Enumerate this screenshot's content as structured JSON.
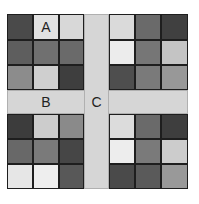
{
  "labels": {
    "a": "A",
    "b": "B",
    "c": "C"
  },
  "strip_color": "#d6d6d6",
  "blocks": {
    "top_left": [
      [
        "#4a4a4a",
        "#e2e2e2",
        "#d8d8d8"
      ],
      [
        "#5e5e5e",
        "#707070",
        "#6a6a6a"
      ],
      [
        "#8c8c8c",
        "#cfcfcf",
        "#3e3e3e"
      ]
    ],
    "top_right": [
      [
        "#dadada",
        "#6a6a6a",
        "#404040"
      ],
      [
        "#ececec",
        "#767676",
        "#c4c4c4"
      ],
      [
        "#4e4e4e",
        "#7a7a7a",
        "#989898"
      ]
    ],
    "bottom_left": [
      [
        "#3c3c3c",
        "#cccccc",
        "#8a8a8a"
      ],
      [
        "#686868",
        "#7a7a7a",
        "#464646"
      ],
      [
        "#e6e6e6",
        "#eeeeee",
        "#585858"
      ]
    ],
    "bottom_right": [
      [
        "#dcdcdc",
        "#6a6a6a",
        "#3e3e3e"
      ],
      [
        "#ededed",
        "#7a7a7a",
        "#cccccc"
      ],
      [
        "#4a4a4a",
        "#5a5a5a",
        "#999999"
      ]
    ]
  }
}
